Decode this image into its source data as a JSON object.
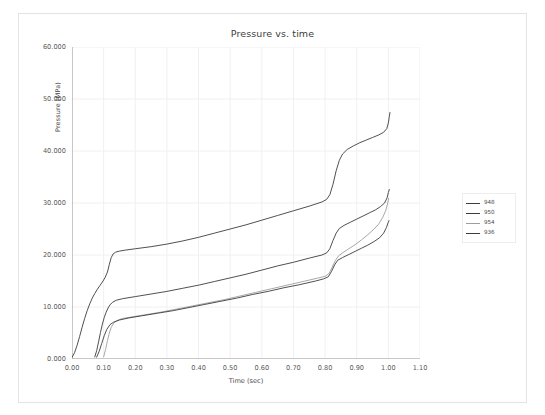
{
  "figure": {
    "title": "Pressure vs. time",
    "background": "#ffffff",
    "frame_color": "#e3e3e3"
  },
  "axes": {
    "xlabel": "Time (sec)",
    "ylabel": "Pressure (MPa)",
    "xticks": [
      "0.00",
      "0.10",
      "0.20",
      "0.30",
      "0.40",
      "0.50",
      "0.60",
      "0.70",
      "0.80",
      "0.90",
      "1.00",
      "1.10"
    ],
    "yticks": [
      "0.000",
      "10.000",
      "20.000",
      "30.000",
      "40.000",
      "50.000",
      "60.000"
    ],
    "grid": "on",
    "grid_color": "#f0f0f0",
    "axis_color": "#9a9a9a"
  },
  "legend": {
    "position": "right-outside",
    "entries": [
      {
        "label": "948",
        "color": "#3c3c3c"
      },
      {
        "label": "950",
        "color": "#3c3c3c"
      },
      {
        "label": "954",
        "color": "#9e9e9e"
      },
      {
        "label": "936",
        "color": "#3c3c3c"
      }
    ]
  },
  "chart_data": {
    "type": "line",
    "title": "Pressure vs. time",
    "xlabel": "Time (sec)",
    "ylabel": "Pressure (MPa)",
    "xlim": [
      0.0,
      1.1
    ],
    "ylim": [
      0.0,
      60.0
    ],
    "xticks": [
      0.0,
      0.1,
      0.2,
      0.3,
      0.4,
      0.5,
      0.6,
      0.7,
      0.8,
      0.9,
      1.0,
      1.1
    ],
    "yticks": [
      0,
      10,
      20,
      30,
      40,
      50,
      60
    ],
    "grid": true,
    "legend_position": "right-outside",
    "series": [
      {
        "name": "948",
        "color": "#3c3c3c",
        "points": [
          [
            0.0,
            0.3
          ],
          [
            0.008,
            1.2
          ],
          [
            0.016,
            2.6
          ],
          [
            0.024,
            4.3
          ],
          [
            0.032,
            6.1
          ],
          [
            0.04,
            7.8
          ],
          [
            0.048,
            9.3
          ],
          [
            0.056,
            10.6
          ],
          [
            0.064,
            11.7
          ],
          [
            0.072,
            12.6
          ],
          [
            0.08,
            13.4
          ],
          [
            0.088,
            14.1
          ],
          [
            0.096,
            14.8
          ],
          [
            0.104,
            15.6
          ],
          [
            0.112,
            16.7
          ],
          [
            0.118,
            18.2
          ],
          [
            0.124,
            19.5
          ],
          [
            0.13,
            20.2
          ],
          [
            0.138,
            20.55
          ],
          [
            0.15,
            20.75
          ],
          [
            0.17,
            20.95
          ],
          [
            0.2,
            21.2
          ],
          [
            0.25,
            21.6
          ],
          [
            0.3,
            22.1
          ],
          [
            0.35,
            22.7
          ],
          [
            0.4,
            23.4
          ],
          [
            0.45,
            24.2
          ],
          [
            0.5,
            25.0
          ],
          [
            0.55,
            25.8
          ],
          [
            0.6,
            26.7
          ],
          [
            0.65,
            27.6
          ],
          [
            0.7,
            28.5
          ],
          [
            0.75,
            29.4
          ],
          [
            0.79,
            30.2
          ],
          [
            0.805,
            30.7
          ],
          [
            0.815,
            31.6
          ],
          [
            0.825,
            33.6
          ],
          [
            0.835,
            36.2
          ],
          [
            0.845,
            38.2
          ],
          [
            0.855,
            39.4
          ],
          [
            0.87,
            40.3
          ],
          [
            0.89,
            41.0
          ],
          [
            0.91,
            41.6
          ],
          [
            0.93,
            42.1
          ],
          [
            0.95,
            42.6
          ],
          [
            0.97,
            43.1
          ],
          [
            0.985,
            43.6
          ],
          [
            0.995,
            44.3
          ],
          [
            1.0,
            45.4
          ],
          [
            1.003,
            46.6
          ],
          [
            1.005,
            47.4
          ]
        ]
      },
      {
        "name": "950",
        "color": "#3c3c3c",
        "points": [
          [
            0.072,
            0.4
          ],
          [
            0.078,
            1.6
          ],
          [
            0.084,
            3.3
          ],
          [
            0.09,
            5.1
          ],
          [
            0.096,
            6.7
          ],
          [
            0.102,
            8.0
          ],
          [
            0.108,
            9.0
          ],
          [
            0.114,
            9.8
          ],
          [
            0.12,
            10.4
          ],
          [
            0.128,
            10.9
          ],
          [
            0.14,
            11.3
          ],
          [
            0.16,
            11.6
          ],
          [
            0.2,
            12.0
          ],
          [
            0.25,
            12.5
          ],
          [
            0.3,
            13.0
          ],
          [
            0.35,
            13.6
          ],
          [
            0.4,
            14.2
          ],
          [
            0.45,
            14.9
          ],
          [
            0.5,
            15.6
          ],
          [
            0.55,
            16.3
          ],
          [
            0.6,
            17.1
          ],
          [
            0.65,
            17.9
          ],
          [
            0.7,
            18.6
          ],
          [
            0.75,
            19.4
          ],
          [
            0.79,
            20.0
          ],
          [
            0.805,
            20.4
          ],
          [
            0.815,
            21.2
          ],
          [
            0.825,
            22.8
          ],
          [
            0.835,
            24.2
          ],
          [
            0.845,
            25.1
          ],
          [
            0.86,
            25.7
          ],
          [
            0.88,
            26.3
          ],
          [
            0.9,
            26.9
          ],
          [
            0.92,
            27.5
          ],
          [
            0.94,
            28.1
          ],
          [
            0.96,
            28.7
          ],
          [
            0.975,
            29.3
          ],
          [
            0.988,
            30.0
          ],
          [
            0.996,
            31.0
          ],
          [
            1.0,
            32.0
          ],
          [
            1.003,
            32.6
          ]
        ]
      },
      {
        "name": "954",
        "color": "#9e9e9e",
        "points": [
          [
            0.1,
            0.4
          ],
          [
            0.106,
            1.8
          ],
          [
            0.112,
            3.5
          ],
          [
            0.118,
            5.0
          ],
          [
            0.124,
            6.1
          ],
          [
            0.132,
            6.9
          ],
          [
            0.142,
            7.4
          ],
          [
            0.16,
            7.8
          ],
          [
            0.19,
            8.1
          ],
          [
            0.23,
            8.5
          ],
          [
            0.28,
            9.0
          ],
          [
            0.33,
            9.6
          ],
          [
            0.38,
            10.2
          ],
          [
            0.43,
            10.8
          ],
          [
            0.48,
            11.4
          ],
          [
            0.53,
            12.1
          ],
          [
            0.58,
            12.8
          ],
          [
            0.63,
            13.5
          ],
          [
            0.68,
            14.2
          ],
          [
            0.73,
            14.9
          ],
          [
            0.78,
            15.6
          ],
          [
            0.8,
            15.9
          ],
          [
            0.812,
            16.4
          ],
          [
            0.822,
            17.6
          ],
          [
            0.832,
            18.9
          ],
          [
            0.842,
            19.8
          ],
          [
            0.855,
            20.4
          ],
          [
            0.875,
            21.2
          ],
          [
            0.895,
            22.0
          ],
          [
            0.915,
            22.9
          ],
          [
            0.935,
            23.9
          ],
          [
            0.955,
            25.0
          ],
          [
            0.97,
            26.0
          ],
          [
            0.982,
            27.2
          ],
          [
            0.992,
            28.6
          ],
          [
            0.998,
            30.0
          ],
          [
            1.001,
            30.9
          ]
        ]
      },
      {
        "name": "936",
        "color": "#3c3c3c",
        "points": [
          [
            0.078,
            0.35
          ],
          [
            0.086,
            1.5
          ],
          [
            0.094,
            3.0
          ],
          [
            0.102,
            4.5
          ],
          [
            0.11,
            5.7
          ],
          [
            0.12,
            6.6
          ],
          [
            0.132,
            7.1
          ],
          [
            0.15,
            7.5
          ],
          [
            0.18,
            7.9
          ],
          [
            0.22,
            8.3
          ],
          [
            0.27,
            8.8
          ],
          [
            0.32,
            9.3
          ],
          [
            0.37,
            9.9
          ],
          [
            0.42,
            10.5
          ],
          [
            0.47,
            11.1
          ],
          [
            0.52,
            11.7
          ],
          [
            0.57,
            12.4
          ],
          [
            0.62,
            13.0
          ],
          [
            0.67,
            13.7
          ],
          [
            0.72,
            14.3
          ],
          [
            0.77,
            15.0
          ],
          [
            0.795,
            15.4
          ],
          [
            0.81,
            15.8
          ],
          [
            0.82,
            16.8
          ],
          [
            0.83,
            18.1
          ],
          [
            0.84,
            19.0
          ],
          [
            0.855,
            19.5
          ],
          [
            0.875,
            20.1
          ],
          [
            0.895,
            20.7
          ],
          [
            0.915,
            21.3
          ],
          [
            0.935,
            21.9
          ],
          [
            0.955,
            22.6
          ],
          [
            0.972,
            23.3
          ],
          [
            0.985,
            24.2
          ],
          [
            0.994,
            25.3
          ],
          [
            0.999,
            26.2
          ],
          [
            1.002,
            26.6
          ]
        ]
      }
    ]
  }
}
